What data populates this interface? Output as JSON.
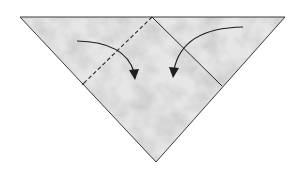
{
  "diagram": {
    "type": "origami-step",
    "colors": {
      "background": "#ffffff",
      "paper_base": "#e2e2e2",
      "paper_light": "#f2f2f2",
      "paper_dark": "#9a9a9a",
      "outline": "#3a3a3a",
      "fold_line": "#2a2a2a",
      "arrow": "#1e1e1e"
    },
    "shape": {
      "triangle_points": [
        [
          20,
          17
        ],
        [
          285,
          17
        ],
        [
          156,
          162
        ]
      ],
      "square_points": [
        [
          152,
          17
        ],
        [
          222,
          86
        ],
        [
          156,
          162
        ],
        [
          83,
          84
        ]
      ]
    },
    "fold_lines": [
      {
        "name": "left-valley-fold",
        "style": "dashed",
        "from": [
          152,
          17
        ],
        "to": [
          83,
          84
        ]
      },
      {
        "name": "right-fold",
        "style": "solid",
        "from": [
          152,
          17
        ],
        "to": [
          222,
          86
        ]
      }
    ],
    "arrows": [
      {
        "name": "left-fold-arrow",
        "start": [
          77,
          41
        ],
        "control": [
          125,
          42
        ],
        "end": [
          135,
          78
        ]
      },
      {
        "name": "right-fold-arrow",
        "start": [
          243,
          27
        ],
        "control": [
          182,
          28
        ],
        "end": [
          173,
          76
        ]
      }
    ]
  }
}
